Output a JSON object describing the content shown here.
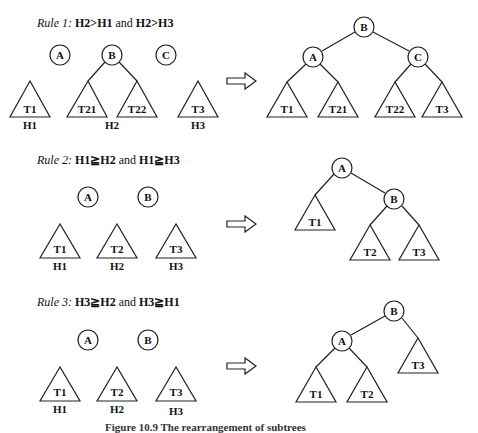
{
  "rules": [
    {
      "label_prefix": "Rule 1:",
      "condition_a": "H2",
      "op1": ">",
      "condition_b": "H1",
      "conj": "and",
      "condition_c": "H2",
      "op2": ">",
      "condition_d": "H3",
      "before": {
        "nodes": [
          "A",
          "B",
          "C"
        ],
        "subtrees": [
          "T1",
          "T21",
          "T22",
          "T3"
        ],
        "heights": [
          "H1",
          "H2",
          "H3"
        ]
      },
      "after": {
        "root": "B",
        "internal": [
          "A",
          "C"
        ],
        "subtrees": [
          "T1",
          "T21",
          "T22",
          "T3"
        ]
      }
    },
    {
      "label_prefix": "Rule 2:",
      "condition_a": "H1",
      "op1": "≧",
      "condition_b": "H2",
      "conj": "and",
      "condition_c": "H1",
      "op2": "≧",
      "condition_d": "H3",
      "before": {
        "nodes": [
          "A",
          "B"
        ],
        "subtrees": [
          "T1",
          "T2",
          "T3"
        ],
        "heights": [
          "H1",
          "H2",
          "H3"
        ]
      },
      "after": {
        "root": "A",
        "internal": [
          "B"
        ],
        "subtrees": [
          "T1",
          "T2",
          "T3"
        ]
      }
    },
    {
      "label_prefix": "Rule 3:",
      "condition_a": "H3",
      "op1": "≧",
      "condition_b": "H2",
      "conj": "and",
      "condition_c": "H3",
      "op2": "≧",
      "condition_d": "H1",
      "before": {
        "nodes": [
          "A",
          "B"
        ],
        "subtrees": [
          "T1",
          "T2",
          "T3"
        ],
        "heights": [
          "H1",
          "H2",
          "H3"
        ]
      },
      "after": {
        "root": "B",
        "internal": [
          "A"
        ],
        "subtrees": [
          "T1",
          "T2",
          "T3"
        ]
      }
    }
  ],
  "caption": "Figure 10.9   The rearrangement of subtrees"
}
